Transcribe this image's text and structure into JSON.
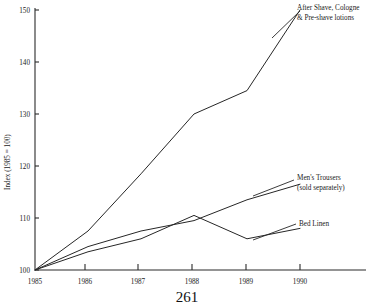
{
  "chart_data": {
    "type": "line",
    "title": "",
    "xlabel": "",
    "ylabel": "Index (1985 = 100)",
    "x": [
      1985,
      1986,
      1987,
      1988,
      1989,
      1990
    ],
    "xtick_labels": [
      "1985",
      "1986",
      "1987",
      "1988",
      "1989",
      "1990"
    ],
    "ytick_labels": [
      "100",
      "110",
      "120",
      "130",
      "140",
      "150"
    ],
    "yticks": [
      100,
      110,
      120,
      130,
      140,
      150
    ],
    "ylim": [
      100,
      150
    ],
    "xlim": [
      1985,
      1990
    ],
    "grid": false,
    "legend": "annotations-right",
    "series": [
      {
        "name": "After Shave, Cologne & Pre-shave lotions",
        "values": [
          100,
          107.5,
          118.5,
          130,
          134.5,
          150
        ]
      },
      {
        "name": "Men's Trousers (sold separately)",
        "values": [
          100,
          104.5,
          107.5,
          109.5,
          113.5,
          116.5
        ]
      },
      {
        "name": "Bed Linen",
        "values": [
          100,
          103.5,
          106,
          110.5,
          106,
          108
        ]
      }
    ],
    "annotations": [
      {
        "line1": "After Shave, Cologne",
        "line2": "& Pre-shave lotions"
      },
      {
        "line1": "Men's Trousers",
        "line2": "(sold separately)"
      },
      {
        "line1": "Bed Linen",
        "line2": ""
      }
    ]
  },
  "page": {
    "number": "261"
  }
}
